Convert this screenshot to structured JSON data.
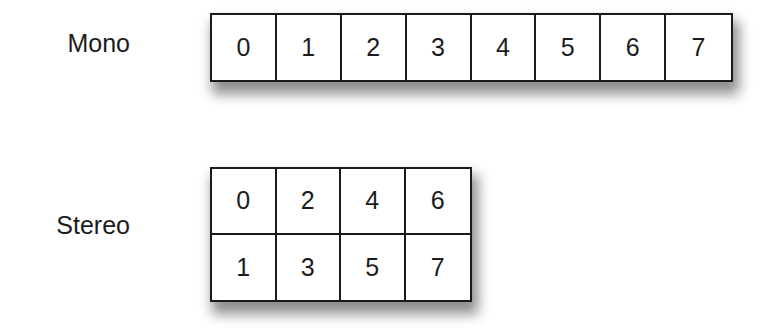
{
  "diagram": {
    "mono": {
      "label": "Mono",
      "layout": "1 row x 8 columns",
      "cells": [
        "0",
        "1",
        "2",
        "3",
        "4",
        "5",
        "6",
        "7"
      ]
    },
    "stereo": {
      "label": "Stereo",
      "layout": "2 rows x 4 columns",
      "rows": [
        [
          "0",
          "2",
          "4",
          "6"
        ],
        [
          "1",
          "3",
          "5",
          "7"
        ]
      ]
    }
  }
}
